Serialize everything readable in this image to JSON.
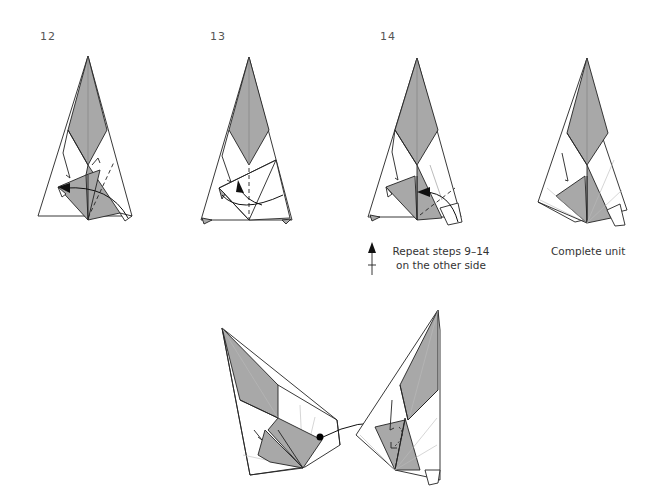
{
  "steps": [
    {
      "number": "12",
      "action": "fold and arrow pointing left along dashed valley fold"
    },
    {
      "number": "13",
      "action": "fold flap up-left with curved arrow"
    },
    {
      "number": "14",
      "action": "fold flap left along dashed line"
    }
  ],
  "repeat_note": {
    "line1": "Repeat steps 9–14",
    "line2": "on the other side",
    "icon": "turn-over-arrow-icon"
  },
  "complete_unit": {
    "label": "Complete unit"
  },
  "assembly": {
    "description": "Two units joined; dot on left unit connects via curved arrow to pocket on right unit"
  },
  "colors": {
    "paper_colored": "#a8a8a8",
    "paper_white": "#ffffff",
    "line": "#222222",
    "text": "#555555"
  }
}
